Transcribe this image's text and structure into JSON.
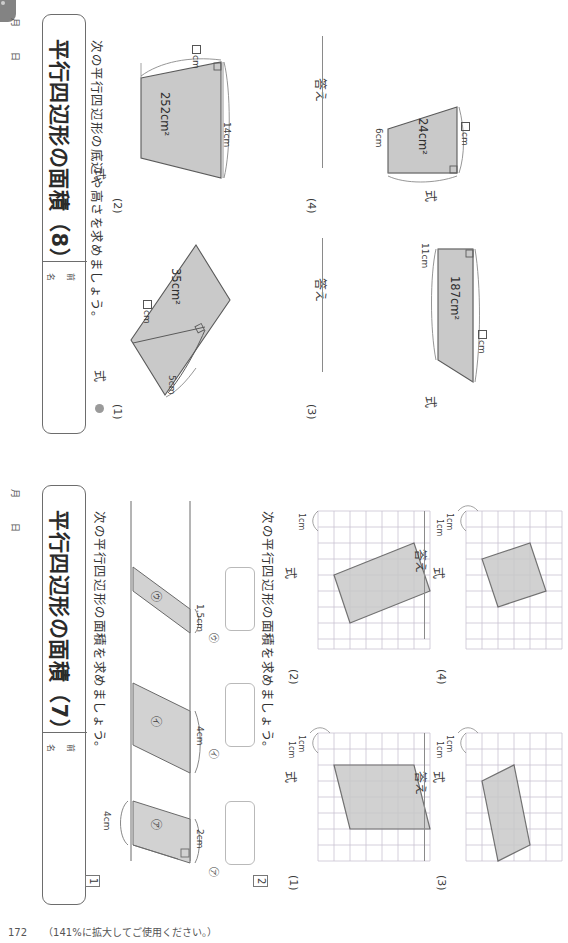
{
  "document": {
    "kind": "japanese-math-worksheet-scan",
    "footer": {
      "page_number": "172",
      "note": "（141%に拡大してご使用ください。）"
    }
  },
  "sheet8": {
    "title": "平行四辺形の面積（8）",
    "name_label_1": "名",
    "name_label_2": "前",
    "date_month": "月",
    "date_day": "日",
    "instruction": "次の平行四辺形の底辺や高さを求めましょう。",
    "shiki_label": "式",
    "kotae_label": "答え",
    "problems": [
      {
        "num": "(1)",
        "area": "35cm²",
        "known_side": "5cm",
        "unknown": "cm",
        "unknown_box": "□"
      },
      {
        "num": "(2)",
        "area": "252cm²",
        "known_side": "14cm",
        "unknown": "cm",
        "unknown_box": "□"
      },
      {
        "num": "(3)",
        "area": "187cm²",
        "known_side": "11cm",
        "unknown": "cm",
        "unknown_box": "□"
      },
      {
        "num": "(4)",
        "area": "24cm²",
        "known_side": "6cm",
        "unknown": "cm",
        "unknown_box": "□"
      }
    ]
  },
  "sheet7": {
    "title": "平行四辺形の面積（7）",
    "name_label_1": "名",
    "name_label_2": "前",
    "date_month": "月",
    "date_day": "日",
    "q1_number": "1",
    "q1_instruction": "次の平行四辺形の面積を求めましょう。",
    "q1_base": "4cm",
    "q1_shapes": [
      {
        "label": "㋐",
        "height": "2cm"
      },
      {
        "label": "㋑",
        "height": "4cm"
      },
      {
        "label": "㋒",
        "height": "1.5cm"
      }
    ],
    "q1_answer_labels": [
      "㋐",
      "㋑",
      "㋒"
    ],
    "q2_number": "2",
    "q2_instruction": "次の平行四辺形の面積を求めましょう。",
    "q2_unit_label": "1cm",
    "q2_shiki_label": "式",
    "q2_kotae_label": "答え",
    "q2_problems": [
      {
        "num": "(1)"
      },
      {
        "num": "(2)"
      },
      {
        "num": "(3)"
      },
      {
        "num": "(4)"
      }
    ]
  },
  "colors": {
    "shape_fill": "#c9c9c9",
    "shape_stroke": "#5a5a5a",
    "grid_line": "#c9c3d2",
    "rule_line": "#8a8a8a",
    "text": "#3a3a3a"
  }
}
